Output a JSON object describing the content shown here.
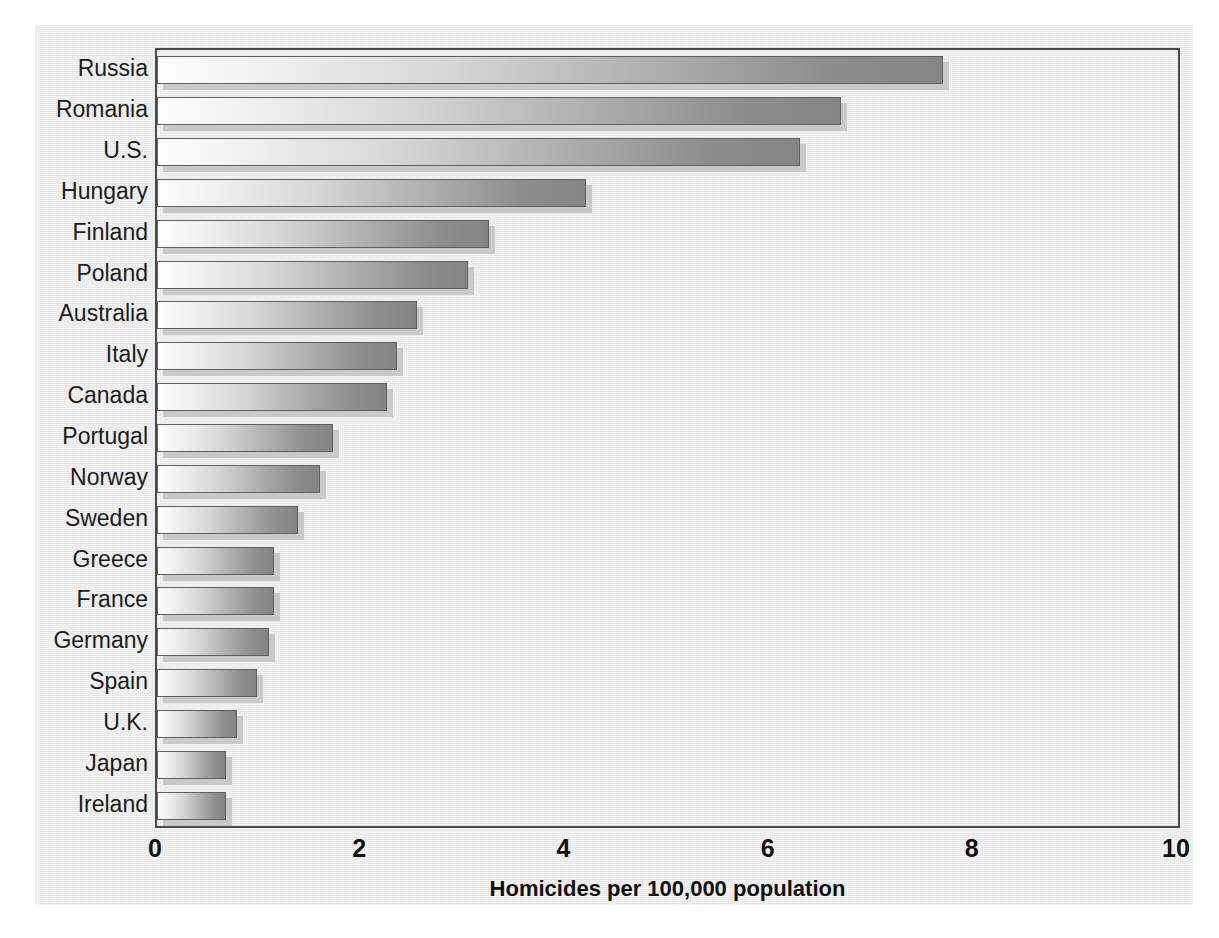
{
  "chart_data": {
    "type": "bar",
    "orientation": "horizontal",
    "title": "",
    "xlabel": "Homicides per 100,000 population",
    "ylabel": "",
    "xlim": [
      0,
      10
    ],
    "xticks": [
      "0",
      "2",
      "4",
      "6",
      "8",
      "10"
    ],
    "xtick_values": [
      0,
      2,
      4,
      6,
      8,
      10
    ],
    "grid": false,
    "legend": false,
    "categories": [
      "Russia",
      "Romania",
      "U.S.",
      "Hungary",
      "Finland",
      "Poland",
      "Australia",
      "Italy",
      "Canada",
      "Portugal",
      "Norway",
      "Sweden",
      "Greece",
      "France",
      "Germany",
      "Spain",
      "U.K.",
      "Japan",
      "Ireland"
    ],
    "values": [
      7.7,
      6.7,
      6.3,
      4.2,
      3.25,
      3.05,
      2.55,
      2.35,
      2.25,
      1.72,
      1.6,
      1.38,
      1.15,
      1.15,
      1.1,
      0.98,
      0.78,
      0.68,
      0.68
    ],
    "bars": [
      {
        "label": "Russia",
        "value": 7.7
      },
      {
        "label": "Romania",
        "value": 6.7
      },
      {
        "label": "U.S.",
        "value": 6.3
      },
      {
        "label": "Hungary",
        "value": 4.2
      },
      {
        "label": "Finland",
        "value": 3.25
      },
      {
        "label": "Poland",
        "value": 3.05
      },
      {
        "label": "Australia",
        "value": 2.55
      },
      {
        "label": "Italy",
        "value": 2.35
      },
      {
        "label": "Canada",
        "value": 2.25
      },
      {
        "label": "Portugal",
        "value": 1.72
      },
      {
        "label": "Norway",
        "value": 1.6
      },
      {
        "label": "Sweden",
        "value": 1.38
      },
      {
        "label": "Greece",
        "value": 1.15
      },
      {
        "label": "France",
        "value": 1.15
      },
      {
        "label": "Germany",
        "value": 1.1
      },
      {
        "label": "Spain",
        "value": 0.98
      },
      {
        "label": "U.K.",
        "value": 0.78
      },
      {
        "label": "Japan",
        "value": 0.68
      },
      {
        "label": "Ireland",
        "value": 0.68
      }
    ],
    "colors": {
      "panel_background": "#e7e7e7",
      "page_background": "#ffffff",
      "bar_gradient_start": "#fdfdfd",
      "bar_gradient_end": "#848484",
      "bar_border": "#5f5f5f",
      "bar_shadow": "#c9c9c9",
      "axis_line": "#4a4a4a",
      "text": "#1c1c1c"
    }
  },
  "caption": {
    "text": ""
  }
}
